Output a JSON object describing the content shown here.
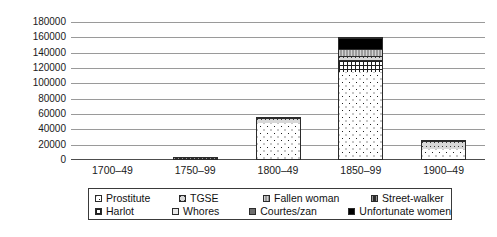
{
  "chart_data": {
    "type": "bar",
    "stacked": true,
    "title": "",
    "subtitle": "",
    "xlabel": "",
    "ylabel": "",
    "grid": true,
    "legend_position": "bottom",
    "ylim": [
      0,
      180000
    ],
    "ytick_labels": [
      "180000",
      "160000",
      "140000",
      "120000",
      "100000",
      "80000",
      "60000",
      "40000",
      "20000",
      "0"
    ],
    "yticks": [
      180000,
      160000,
      140000,
      120000,
      100000,
      80000,
      60000,
      40000,
      20000,
      0
    ],
    "categories": [
      "1700–49",
      "1750–99",
      "1800–49",
      "1850–99",
      "1900–49"
    ],
    "series": [
      {
        "name": "Prostitute",
        "pattern": "p-prostitute",
        "values": [
          0,
          0,
          49000,
          116000,
          14000
        ]
      },
      {
        "name": "Harlot",
        "pattern": "p-harlot",
        "values": [
          0,
          0,
          0,
          15000,
          0
        ]
      },
      {
        "name": "TGSE",
        "pattern": "p-tgse",
        "values": [
          0,
          0,
          7000,
          6000,
          12000
        ]
      },
      {
        "name": "Whores",
        "pattern": "p-whores",
        "values": [
          0,
          0,
          0,
          0,
          0
        ]
      },
      {
        "name": "Fallen woman",
        "pattern": "p-fallen",
        "values": [
          0,
          0,
          0,
          9000,
          0
        ]
      },
      {
        "name": "Courtes/zan",
        "pattern": "p-courtesan",
        "values": [
          0,
          0,
          0,
          0,
          0
        ]
      },
      {
        "name": "Street-walker",
        "pattern": "p-streetwalker",
        "values": [
          0,
          2000,
          0,
          0,
          0
        ]
      },
      {
        "name": "Unfortunate women",
        "pattern": "p-unfortunate",
        "values": [
          0,
          0,
          0,
          14000,
          0
        ]
      }
    ],
    "totals": [
      0,
      2000,
      56000,
      160000,
      26000
    ]
  },
  "legend": {
    "rows": [
      [
        {
          "label": "Prostitute",
          "swatch": "p-prostitute"
        },
        {
          "label": "TGSE",
          "swatch": "p-tgse"
        },
        {
          "label": "Fallen woman",
          "swatch": "p-fallen"
        },
        {
          "label": "Street-walker",
          "swatch": "p-streetwalker"
        }
      ],
      [
        {
          "label": "Harlot",
          "swatch": "p-harlot"
        },
        {
          "label": "Whores",
          "swatch": "p-whores"
        },
        {
          "label": "Courtes/zan",
          "swatch": "p-courtesan"
        },
        {
          "label": "Unfortunate women",
          "swatch": "p-unfortunate"
        }
      ]
    ]
  }
}
